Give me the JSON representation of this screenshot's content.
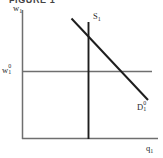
{
  "figure": {
    "caption": "FIGURE 1",
    "background_color": "#ffffff",
    "axis_color": "#6f6f6f",
    "curve_color": "#1e1e1e",
    "label_color": "#2a2a2a"
  },
  "labels": {
    "y_axis": {
      "base": "w",
      "sub": "1",
      "sup": ""
    },
    "x_axis": {
      "base": "q",
      "sub": "1",
      "sup": ""
    },
    "wage_level": {
      "base": "w",
      "sub": "1",
      "sup": "0"
    },
    "supply_curve": {
      "base": "S",
      "sub": "1",
      "sup": ""
    },
    "demand_curve": {
      "base": "D",
      "sub": "1",
      "sup": "0"
    }
  },
  "chart_data": {
    "type": "line",
    "title": "FIGURE 1",
    "xlabel": "q₁",
    "ylabel": "w₁",
    "xlim": [
      0,
      163
    ],
    "ylim": [
      0,
      158
    ],
    "grid": false,
    "legend": "none",
    "axes": {
      "y_axis_line": {
        "x": 22.5,
        "y_top": 10,
        "y_bottom": 139
      },
      "x_axis_line": {
        "y": 138.5,
        "x_left": 22,
        "x_right": 158
      }
    },
    "series": [
      {
        "name": "S₁",
        "kind": "vertical-supply-curve",
        "points": [
          [
            88.5,
            22
          ],
          [
            88.5,
            139
          ]
        ],
        "color": "#1e1e1e",
        "width": 1.9,
        "label": "S₁",
        "label_pos": [
          93,
          12
        ]
      },
      {
        "name": "D₁⁰",
        "kind": "downward-sloping-demand-curve",
        "points": [
          [
            71.5,
            18.5
          ],
          [
            148,
            100
          ]
        ],
        "color": "#1e1e1e",
        "width": 2.0,
        "label": "D₁⁰",
        "label_pos": [
          137,
          101
        ]
      },
      {
        "name": "w₁⁰",
        "kind": "horizontal-wage-line",
        "points": [
          [
            22,
            71.5
          ],
          [
            152,
            71.5
          ]
        ],
        "color": "#6f6f6f",
        "width": 1.4,
        "label": "w₁⁰",
        "label_pos": [
          2,
          64
        ]
      }
    ],
    "annotations": [
      {
        "text": "w₁",
        "x": 13,
        "y": 4,
        "role": "y-axis-title"
      },
      {
        "text": "q₁",
        "x": 146,
        "y": 144,
        "role": "x-axis-title"
      }
    ]
  }
}
